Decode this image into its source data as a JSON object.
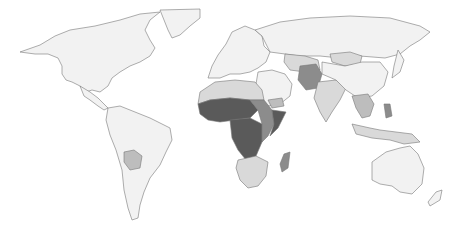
{
  "map": {
    "type": "choropleth",
    "projection": "world",
    "color_scale": [
      "#f2f2f2",
      "#d9d9d9",
      "#bdbdbd",
      "#8c8c8c",
      "#5a5a5a"
    ],
    "ocean_color": "#ffffff",
    "border_color": "#777777",
    "regions": [
      {
        "name": "North America",
        "shade": "#f2f2f2"
      },
      {
        "name": "Greenland",
        "shade": "#f2f2f2"
      },
      {
        "name": "Central America",
        "shade": "#f2f2f2"
      },
      {
        "name": "South America",
        "shade": "#f2f2f2"
      },
      {
        "name": "Bolivia",
        "shade": "#bdbdbd"
      },
      {
        "name": "Europe",
        "shade": "#f2f2f2"
      },
      {
        "name": "Russia",
        "shade": "#f2f2f2"
      },
      {
        "name": "North Africa",
        "shade": "#d9d9d9"
      },
      {
        "name": "Sahel / West Africa",
        "shade": "#5a5a5a"
      },
      {
        "name": "Central Africa",
        "shade": "#5a5a5a"
      },
      {
        "name": "East Africa",
        "shade": "#8c8c8c"
      },
      {
        "name": "Somalia",
        "shade": "#5a5a5a"
      },
      {
        "name": "Southern Africa",
        "shade": "#d9d9d9"
      },
      {
        "name": "Madagascar",
        "shade": "#8c8c8c"
      },
      {
        "name": "Middle East",
        "shade": "#f2f2f2"
      },
      {
        "name": "Yemen",
        "shade": "#bdbdbd"
      },
      {
        "name": "Afghanistan / Pakistan",
        "shade": "#8c8c8c"
      },
      {
        "name": "Central Asia",
        "shade": "#d9d9d9"
      },
      {
        "name": "India",
        "shade": "#d9d9d9"
      },
      {
        "name": "Mongolia",
        "shade": "#d9d9d9"
      },
      {
        "name": "China",
        "shade": "#f2f2f2"
      },
      {
        "name": "Southeast Asia",
        "shade": "#bdbdbd"
      },
      {
        "name": "Philippines",
        "shade": "#8c8c8c"
      },
      {
        "name": "Indonesia / PNG",
        "shade": "#d9d9d9"
      },
      {
        "name": "Australia",
        "shade": "#f2f2f2"
      },
      {
        "name": "New Zealand",
        "shade": "#f2f2f2"
      }
    ]
  }
}
